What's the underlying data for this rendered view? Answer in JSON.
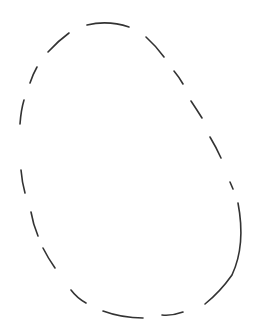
{
  "figure": {
    "width": 260,
    "height": 334,
    "background": "#ffffff",
    "stroke_color": "#333333",
    "stroke_width": 1.6
  },
  "segments": [
    {
      "id": "seg-1",
      "d": "M20,124 Q21,110 24,100"
    },
    {
      "id": "seg-2",
      "d": "M30,83 Q33,74 37,67"
    },
    {
      "id": "seg-3",
      "d": "M48,52 Q58,41 69,33"
    },
    {
      "id": "seg-4",
      "d": "M87,25 Q108,20 129,27"
    },
    {
      "id": "seg-5",
      "d": "M146,37 Q156,46 164,57"
    },
    {
      "id": "seg-6",
      "d": "M174,71 Q179,77 183,84"
    },
    {
      "id": "seg-7",
      "d": "M191,101 Q197,110 202,118"
    },
    {
      "id": "seg-8",
      "d": "M210,137 Q216,147 221,158"
    },
    {
      "id": "seg-9",
      "d": "M230,182 L233,189"
    },
    {
      "id": "seg-10",
      "d": "M238,203 Q246,245 232,275 Q220,292 205,304"
    },
    {
      "id": "seg-11",
      "d": "M183,312 Q172,316 162,315"
    },
    {
      "id": "seg-12",
      "d": "M143,318 Q122,318 103,311"
    },
    {
      "id": "seg-13",
      "d": "M86,303 Q77,298 71,290"
    },
    {
      "id": "seg-14",
      "d": "M55,268 Q48,258 43,248"
    },
    {
      "id": "seg-15",
      "d": "M38,236 Q33,224 31,212"
    },
    {
      "id": "seg-16",
      "d": "M25,193 Q22,182 21,170"
    }
  ]
}
